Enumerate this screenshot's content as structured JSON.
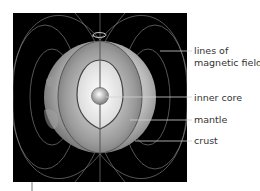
{
  "diagram": {
    "labels": {
      "field_line1": "lines of",
      "field_line2": "magnetic field",
      "inner_core": "inner core",
      "mantle": "mantle",
      "crust": "crust"
    },
    "colors": {
      "background_panel": "#000000",
      "field_lines": "#7a7a7a",
      "globe_light": "#f2f2f2",
      "globe_dark": "#6e6e6e",
      "leader_lines": "#d0d0d0",
      "label_text": "#333333"
    }
  }
}
